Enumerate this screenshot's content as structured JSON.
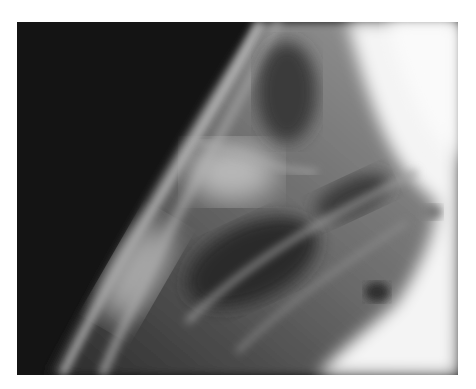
{
  "image": {
    "kind": "radiograph",
    "description": "Grayscale X-ray image showing diagonal bright band of soft tissue/bone structures against dark background on left and bright overexposed region on right",
    "frame": {
      "x": 17,
      "y": 22,
      "width": 441,
      "height": 353
    },
    "colors": {
      "page_background": "#ffffff",
      "dark_region": "#141414",
      "bright_region": "#f4f4f4",
      "mid_tissue": "#5a5a5a"
    }
  }
}
